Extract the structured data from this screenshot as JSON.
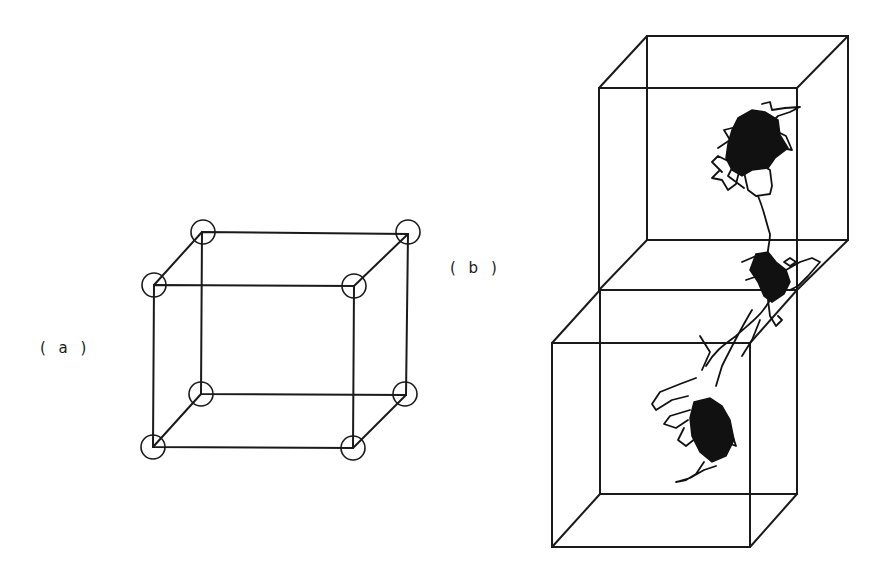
{
  "figure": {
    "panel_a": {
      "label": "( a )",
      "description": "unit cell cube with lattice sites at 8 corners",
      "vertices": {
        "front_top_left": [
          154,
          285
        ],
        "front_top_right": [
          354,
          286
        ],
        "front_bottom_left": [
          153,
          447
        ],
        "front_bottom_right": [
          353,
          448
        ],
        "back_top_left": [
          202,
          232
        ],
        "back_top_right": [
          408,
          234
        ],
        "back_bottom_left": [
          201,
          394
        ],
        "back_bottom_right": [
          406,
          395
        ]
      },
      "node_radius": 12
    },
    "panel_b": {
      "label": "( b )",
      "description": "two stacked cells with a polymer chain trajectory crossing between them",
      "upper_cube": {
        "front": [
          [
            599,
            88
          ],
          [
            797,
            88
          ],
          [
            797,
            290
          ],
          [
            599,
            290
          ]
        ],
        "back": [
          [
            647,
            36
          ],
          [
            848,
            36
          ],
          [
            848,
            240
          ],
          [
            647,
            240
          ]
        ]
      },
      "lower_cube": {
        "front": [
          [
            552,
            343
          ],
          [
            750,
            343
          ],
          [
            750,
            547
          ],
          [
            552,
            547
          ]
        ],
        "back": [
          [
            600,
            290
          ],
          [
            797,
            290
          ],
          [
            797,
            494
          ],
          [
            600,
            494
          ]
        ]
      }
    }
  }
}
